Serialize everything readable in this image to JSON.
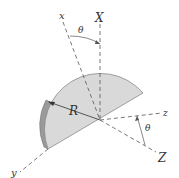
{
  "figure": {
    "type": "mechanics-diagram",
    "colors": {
      "plate_fill": "#d9d9d9",
      "plate_edge": "#8a8a8a",
      "axis_line": "#555555",
      "label": "#333333"
    }
  },
  "labels": {
    "x_body": "x",
    "X_fixed": "X",
    "z_body": "z",
    "Z_fixed": "Z",
    "y_body": "y",
    "radius": "R",
    "theta_top": "θ",
    "theta_right": "θ"
  }
}
